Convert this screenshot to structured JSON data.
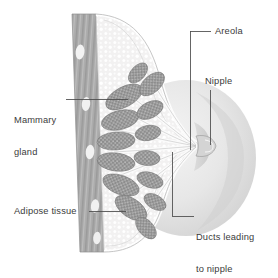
{
  "figure": {
    "type": "medical-anatomy-illustration",
    "style": "grayscale line-and-stipple drawing",
    "background_color": "#ffffff",
    "label_color": "#3b3b3b",
    "leader_color": "#4a4a4a"
  },
  "labels": {
    "areola": "Areola",
    "nipple": "Nipple",
    "mammary_gland_line1": "Mammary",
    "mammary_gland_line2": "gland",
    "adipose_tissue": "Adipose tissue",
    "ducts_line1": "Ducts leading",
    "ducts_line2": "to nipple"
  },
  "structures": [
    {
      "name": "chest-wall-muscle",
      "description": "vertical striated muscle band at left with pale oval inclusions",
      "color": "#a9a9a9"
    },
    {
      "name": "adipose-tissue",
      "description": "stippled fatty tissue filling the breast",
      "color": "#eceaea"
    },
    {
      "name": "mammary-gland-lobules",
      "description": "dark stippled elongated lobes radiating toward the nipple",
      "color": "#8e8e8e"
    },
    {
      "name": "lactiferous-ducts",
      "description": "pale channels converging from lobules to the nipple",
      "color": "#f6f6f6"
    },
    {
      "name": "nipple",
      "description": "protruding tip at the right of the sectioned breast",
      "color": "#d6d6d6"
    },
    {
      "name": "areola",
      "description": "shaded zone surrounding the nipple",
      "color": "#d0d0d0"
    },
    {
      "name": "breast-outer-form",
      "description": "soft gray rounded body of the breast seen behind the section",
      "color": "#e4e4e4"
    }
  ]
}
